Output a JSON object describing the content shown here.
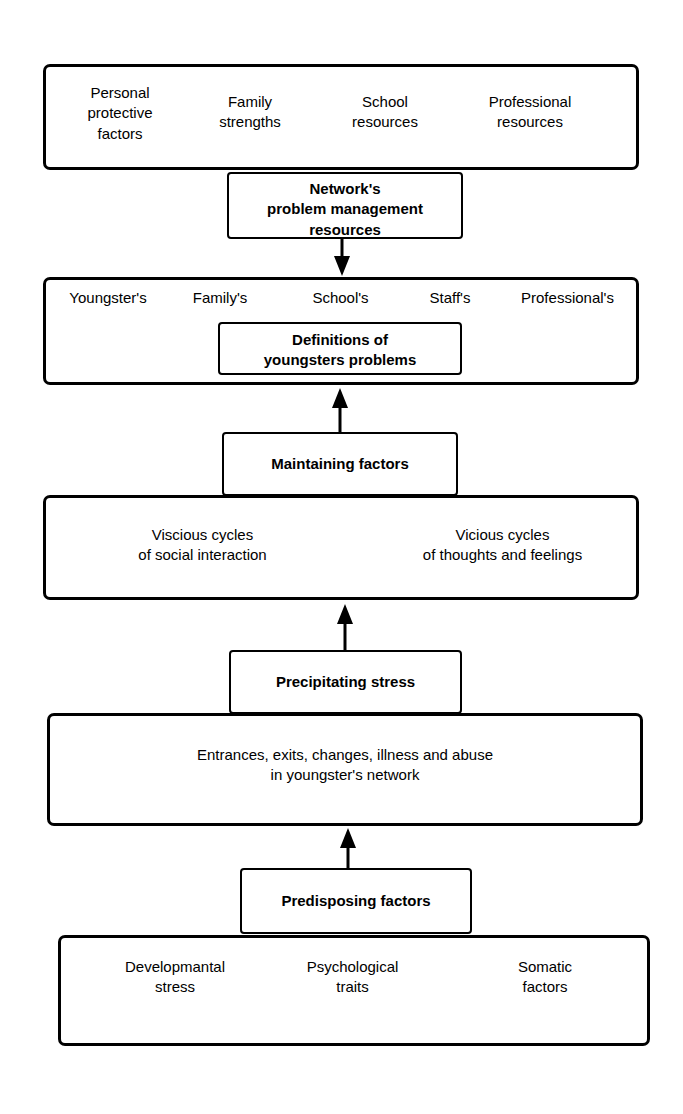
{
  "diagram": {
    "stroke_color": "#000000",
    "fill_color": "#ffffff",
    "levels": [
      {
        "id": "protective-resources",
        "kind": "wide-box",
        "items": [
          "Personal\nprotective\nfactors",
          "Family\nstrengths",
          "School\nresources",
          "Professional\nresources"
        ]
      },
      {
        "id": "network-problem-management-resources",
        "kind": "label-box",
        "label": "Network's\nproblem management\nresources"
      },
      {
        "id": "definitions-row",
        "kind": "wide-box",
        "items": [
          "Youngster's",
          "Family's",
          "School's",
          "Staff's",
          "Professional's"
        ],
        "inner_label": "Definitions of\nyoungsters problems"
      },
      {
        "id": "maintaining-factors",
        "kind": "label-box",
        "label": "Maintaining factors"
      },
      {
        "id": "cycles-row",
        "kind": "wide-box",
        "items": [
          "Viscious cycles\nof social interaction",
          "Vicious cycles\nof thoughts and feelings"
        ]
      },
      {
        "id": "precipitating-stress",
        "kind": "label-box",
        "label": "Precipitating stress"
      },
      {
        "id": "entrances-row",
        "kind": "wide-box",
        "items": [
          "Entrances, exits, changes, illness and abuse\nin youngster's network"
        ]
      },
      {
        "id": "predisposing-factors",
        "kind": "label-box",
        "label": "Predisposing factors"
      },
      {
        "id": "predisposing-row",
        "kind": "wide-box",
        "items": [
          "Developmantal\nstress",
          "Psychological\ntraits",
          "Somatic\nfactors"
        ]
      }
    ],
    "arrows": [
      {
        "id": "arrow-network-to-definitions",
        "direction": "down"
      },
      {
        "id": "arrow-maintaining-to-definitions",
        "direction": "up"
      },
      {
        "id": "arrow-precipitating-to-cycles",
        "direction": "up"
      },
      {
        "id": "arrow-predisposing-to-entrances",
        "direction": "up"
      }
    ]
  }
}
